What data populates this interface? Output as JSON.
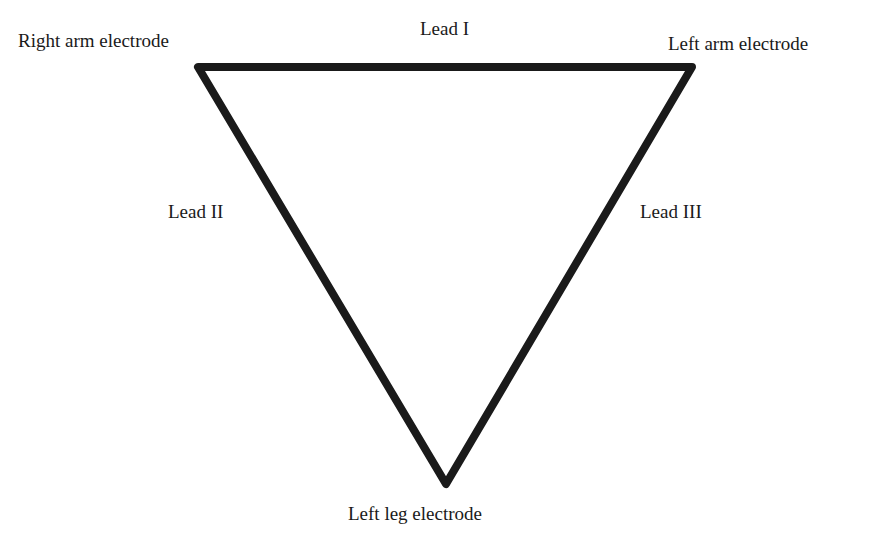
{
  "diagram": {
    "electrodes": {
      "right_arm": "Right arm electrode",
      "left_arm": "Left arm electrode",
      "left_leg": "Left leg electrode"
    },
    "leads": {
      "lead_1": "Lead I",
      "lead_2": "Lead II",
      "lead_3": "Lead III"
    },
    "colors": {
      "line": "#1a1a1a",
      "background": "#ffffff"
    }
  }
}
